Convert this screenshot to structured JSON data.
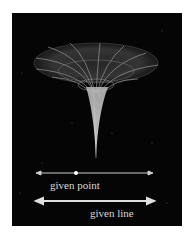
{
  "figure": {
    "background_color": "#050505",
    "surface_color": "#cfcfcf"
  },
  "labels": {
    "point": "given point",
    "line": "given line"
  }
}
